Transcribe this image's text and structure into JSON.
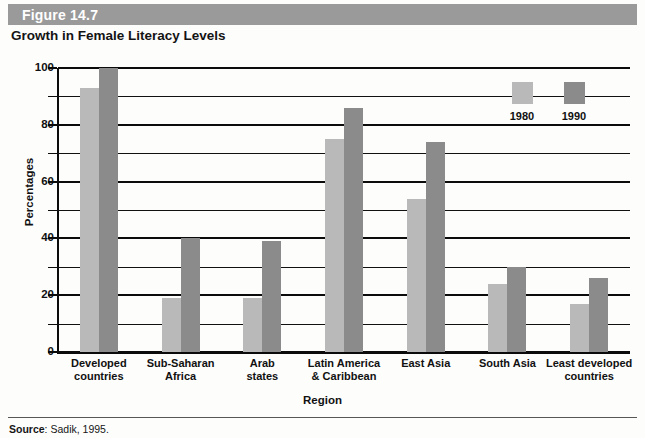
{
  "figure": {
    "number_label": "Figure 14.7",
    "title": "Growth in Female Literacy Levels",
    "source_label": "Source",
    "source_sep": ": ",
    "source_text": "Sadik, 1995."
  },
  "colors": {
    "header_bar": "#9a9a9a",
    "series_1980": "#b9b9b9",
    "series_1990": "#8b8b8b",
    "axis": "#0b0b0b",
    "background": "#fdfdfc"
  },
  "legend": {
    "entries": [
      {
        "label": "1980",
        "color": "#b9b9b9"
      },
      {
        "label": "1990",
        "color": "#8b8b8b"
      }
    ]
  },
  "chart_data": {
    "type": "bar",
    "title": "Growth in Female Literacy Levels",
    "subtitle": "",
    "xlabel": "Region",
    "ylabel": "Percentages",
    "ylim": [
      0,
      100
    ],
    "yticks": [
      0,
      20,
      40,
      60,
      80,
      100
    ],
    "ytick_labels": [
      "0",
      "20",
      "40",
      "60",
      "80",
      "100"
    ],
    "minor_gridlines": [
      10,
      30,
      50,
      70,
      90
    ],
    "grid": true,
    "legend_position": "top-right",
    "categories": [
      "Developed countries",
      "Sub-Saharan Africa",
      "Arab states",
      "Latin America & Caribbean",
      "East Asia",
      "South Asia",
      "Least developed countries"
    ],
    "category_lines": [
      [
        "Developed",
        "countries"
      ],
      [
        "Sub-Saharan",
        "Africa"
      ],
      [
        "Arab",
        "states"
      ],
      [
        "Latin America",
        "& Caribbean"
      ],
      [
        "East Asia"
      ],
      [
        "South Asia"
      ],
      [
        "Least developed",
        "countries"
      ]
    ],
    "series": [
      {
        "name": "1980",
        "color": "#b9b9b9",
        "values": [
          93,
          19,
          19,
          75,
          54,
          24,
          17
        ]
      },
      {
        "name": "1990",
        "color": "#8b8b8b",
        "values": [
          100,
          40,
          39,
          86,
          74,
          30,
          26
        ]
      }
    ]
  }
}
